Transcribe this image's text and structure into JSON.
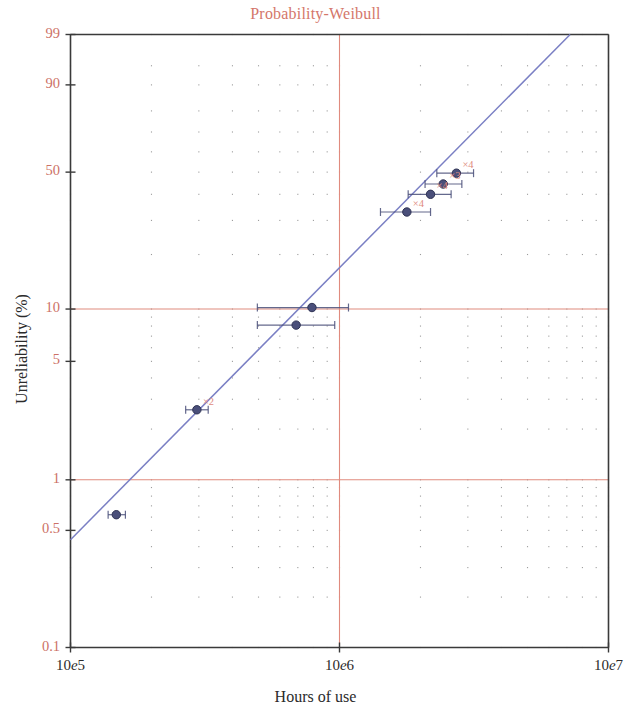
{
  "chart_data": {
    "type": "scatter",
    "title": "Probability-Weibull",
    "xlabel": "Hours of use",
    "ylabel": "Unreliability (%)",
    "x_scale": "log",
    "y_scale": "weibull-probability",
    "xlim": [
      100000,
      10000000
    ],
    "ylim": [
      0.1,
      99
    ],
    "grid": true,
    "legend": "none",
    "x_ticks": [
      {
        "label": "10e5",
        "value": 100000
      },
      {
        "label": "10e6",
        "value": 1000000
      },
      {
        "label": "10e7",
        "value": 10000000
      }
    ],
    "y_ticks": [
      {
        "label": "99",
        "value": 99
      },
      {
        "label": "90",
        "value": 90
      },
      {
        "label": "50",
        "value": 50
      },
      {
        "label": "10",
        "value": 10
      },
      {
        "label": "5",
        "value": 5
      },
      {
        "label": "1",
        "value": 1
      },
      {
        "label": "0.5",
        "value": 0.5
      },
      {
        "label": "0.1",
        "value": 0.1
      }
    ],
    "reference_lines": [
      {
        "orientation": "horizontal",
        "value": 10,
        "color": "#e08b7e"
      },
      {
        "orientation": "horizontal",
        "value": 1,
        "color": "#e08b7e"
      },
      {
        "orientation": "vertical",
        "value": 1000000,
        "color": "#e08b7e"
      }
    ],
    "fit_line": {
      "name": "Weibull fit",
      "color": "#7a7fc4",
      "x_start": 100000,
      "y_start": 0.44,
      "x_end": 7200000,
      "y_end": 99
    },
    "series": [
      {
        "name": "Failure data",
        "color": "#4a4f7a",
        "marker": "filled-circle",
        "points": [
          {
            "x": 148000,
            "y": 0.62,
            "x_low": 138000,
            "x_high": 160000,
            "label": ""
          },
          {
            "x": 295000,
            "y": 2.6,
            "x_low": 268000,
            "x_high": 325000,
            "label": "×2"
          },
          {
            "x": 690000,
            "y": 8.1,
            "x_low": 495000,
            "x_high": 960000,
            "label": ""
          },
          {
            "x": 790000,
            "y": 10.2,
            "x_low": 495000,
            "x_high": 1080000,
            "label": ""
          },
          {
            "x": 1780000,
            "y": 33.0,
            "x_low": 1420000,
            "x_high": 2180000,
            "label": "×4"
          },
          {
            "x": 2180000,
            "y": 40.0,
            "x_low": 1800000,
            "x_high": 2600000,
            "label": "×4"
          },
          {
            "x": 2430000,
            "y": 44.5,
            "x_low": 2080000,
            "x_high": 2850000,
            "label": "×3"
          },
          {
            "x": 2720000,
            "y": 49.5,
            "x_low": 2300000,
            "x_high": 3150000,
            "label": "×4"
          }
        ]
      }
    ]
  },
  "axes": {
    "title": "Probability-Weibull",
    "x_title": "Hours of use",
    "y_title": "Unreliability (%)"
  }
}
